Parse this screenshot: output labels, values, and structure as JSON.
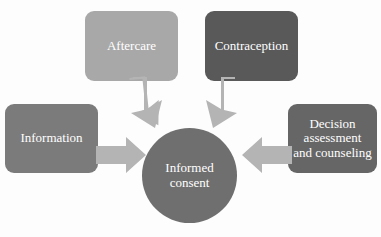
{
  "diagram": {
    "center": {
      "id": "informed-consent",
      "label": "Informed consent",
      "line1": "Informed",
      "line2": "consent",
      "shape": "circle",
      "color": "#6f6f6f",
      "text_color": "#ffffff"
    },
    "nodes": [
      {
        "id": "aftercare",
        "label": "Aftercare",
        "shape": "rounded-rectangle",
        "color": "#a8a8a8",
        "text_color": "#ffffff",
        "position": "top-left"
      },
      {
        "id": "contraception",
        "label": "Contraception",
        "shape": "rounded-rectangle",
        "color": "#595959",
        "text_color": "#ffffff",
        "position": "top-right"
      },
      {
        "id": "information",
        "label": "Information",
        "shape": "rounded-rectangle",
        "color": "#7b7b7b",
        "text_color": "#ffffff",
        "position": "left"
      },
      {
        "id": "decision-assessment",
        "label": "Decision assessment and counseling",
        "line1": "Decision",
        "line2": "assessment",
        "line3": "and counseling",
        "shape": "rounded-rectangle",
        "color": "#666666",
        "text_color": "#ffffff",
        "position": "right"
      }
    ],
    "arrows": [
      {
        "id": "aftercare-to-center",
        "from": "aftercare",
        "to": "informed-consent",
        "direction": "down-right",
        "color": "#b4b4b4"
      },
      {
        "id": "contraception-to-center",
        "from": "contraception",
        "to": "informed-consent",
        "direction": "down-left",
        "color": "#b4b4b4"
      },
      {
        "id": "information-to-center",
        "from": "information",
        "to": "informed-consent",
        "direction": "right",
        "color": "#b4b4b4"
      },
      {
        "id": "decision-to-center",
        "from": "decision-assessment",
        "to": "informed-consent",
        "direction": "left",
        "color": "#b4b4b4"
      }
    ],
    "background_color": "#fdfdfd"
  }
}
